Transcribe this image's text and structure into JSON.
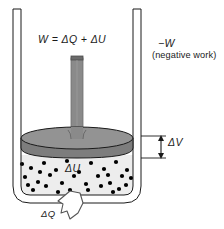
{
  "figure": {
    "labels": {
      "energy_equation": "W = ΔQ + ΔU",
      "negative_work_symbol": "−W",
      "negative_work_note": "(negative work)",
      "volume_change": "ΔV",
      "internal_energy": "ΔU",
      "heat": "ΔQ"
    },
    "colors": {
      "piston_top": "#8f8f8f",
      "piston_rim": "#7a7a7a",
      "rod": "#8a8a8a",
      "gas_fill": "#ededed",
      "gas_particle": "#000000",
      "outline": "#1a1a1a",
      "wall": "#ffffff",
      "background": "#ffffff"
    },
    "elements": {
      "container": "cylinder-vessel",
      "piston": "piston-disc",
      "rod": "piston-rod",
      "gas": "gas-region",
      "dv_arrow": "volume-change-arrow",
      "dq_arrow": "heat-flow-arrow"
    },
    "gas_particles": [
      [
        31,
        168
      ],
      [
        44,
        163
      ],
      [
        56,
        170
      ],
      [
        67,
        161
      ],
      [
        79,
        172
      ],
      [
        91,
        163
      ],
      [
        104,
        169
      ],
      [
        116,
        162
      ],
      [
        127,
        170
      ],
      [
        25,
        177
      ],
      [
        38,
        182
      ],
      [
        50,
        175
      ],
      [
        62,
        183
      ],
      [
        74,
        176
      ],
      [
        86,
        184
      ],
      [
        98,
        176
      ],
      [
        110,
        183
      ],
      [
        122,
        176
      ],
      [
        33,
        190
      ],
      [
        46,
        186
      ],
      [
        58,
        192
      ],
      [
        88,
        190
      ],
      [
        101,
        186
      ],
      [
        113,
        192
      ],
      [
        126,
        185
      ],
      [
        22,
        164
      ],
      [
        131,
        178
      ],
      [
        70,
        190
      ],
      [
        40,
        172
      ],
      [
        108,
        175
      ],
      [
        28,
        185
      ],
      [
        119,
        189
      ]
    ]
  }
}
